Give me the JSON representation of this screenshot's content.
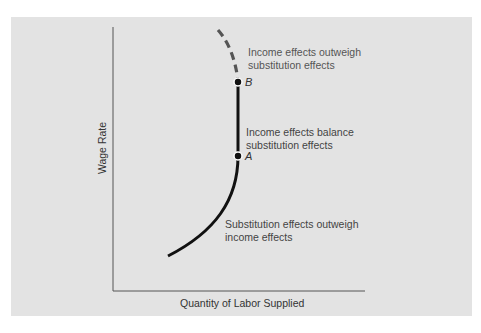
{
  "header": {
    "fragment_text": ""
  },
  "diagram": {
    "x_axis_label": "Quantity of Labor Supplied",
    "y_axis_label": "Wage Rate",
    "points": [
      {
        "id": "B",
        "label": "B"
      },
      {
        "id": "A",
        "label": "A"
      }
    ],
    "annotations": {
      "top": [
        "Income effects outweigh",
        "substitution effects"
      ],
      "middle": [
        "Income effects balance",
        "substitution effects"
      ],
      "bottom": [
        "Substitution effects outweigh",
        "income effects"
      ]
    },
    "colors": {
      "panel": "#e3e3e3",
      "axis": "#555555",
      "curve": "#111111",
      "dashed_curve": "#555555",
      "text": "#444444"
    }
  }
}
